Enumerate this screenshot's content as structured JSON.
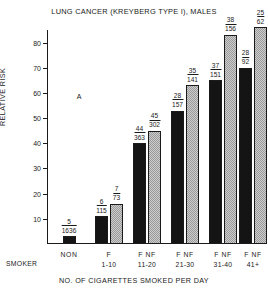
{
  "chart_data": {
    "type": "bar",
    "title": "LUNG CANCER (KREYBERG TYPE I), MALES",
    "xlabel": "NO. OF CIGARETTES SMOKED PER DAY",
    "ylabel": "RELATIVE RISK",
    "ylim": [
      0,
      85
    ],
    "yticks": [
      10,
      20,
      30,
      40,
      50,
      60,
      70,
      80
    ],
    "grid": false,
    "legend": null,
    "annotations": [
      {
        "text": "A",
        "x_frac": 0.14,
        "y_value": 60
      }
    ],
    "categories": [
      "NON SMOKER",
      "1-10",
      "11-20",
      "21-30",
      "31-40",
      "41+"
    ],
    "series": [
      {
        "name": "F",
        "values": [
          3,
          11,
          40,
          53,
          65,
          70
        ]
      },
      {
        "name": "NF",
        "values": [
          null,
          16,
          45,
          63,
          83,
          86
        ]
      }
    ],
    "bars": [
      {
        "group": "NON SMOKER",
        "group_label_lines": [
          "NON",
          ""
        ],
        "type": "non",
        "value": 3,
        "numerator": "5",
        "denominator": "1636"
      },
      {
        "group": "1-10",
        "group_label_lines": [
          "F",
          "1-10"
        ],
        "type": "f",
        "value": 11,
        "numerator": "6",
        "denominator": "115"
      },
      {
        "group": "1-10",
        "group_label_lines": [
          "",
          ""
        ],
        "type": "nf",
        "value": 16,
        "numerator": "7",
        "denominator": "73"
      },
      {
        "group": "11-20",
        "group_label_lines": [
          "F NF",
          "11-20"
        ],
        "type": "f",
        "value": 40,
        "numerator": "44",
        "denominator": "363"
      },
      {
        "group": "11-20",
        "group_label_lines": [
          "",
          ""
        ],
        "type": "nf",
        "value": 45,
        "numerator": "45",
        "denominator": "302"
      },
      {
        "group": "21-30",
        "group_label_lines": [
          "F NF",
          "21-30"
        ],
        "type": "f",
        "value": 53,
        "numerator": "28",
        "denominator": "157"
      },
      {
        "group": "21-30",
        "group_label_lines": [
          "",
          ""
        ],
        "type": "nf",
        "value": 63,
        "numerator": "35",
        "denominator": "141"
      },
      {
        "group": "31-40",
        "group_label_lines": [
          "F NF",
          "31-40"
        ],
        "type": "f",
        "value": 65,
        "numerator": "37",
        "denominator": "151"
      },
      {
        "group": "31-40",
        "group_label_lines": [
          "",
          ""
        ],
        "type": "nf",
        "value": 83,
        "numerator": "38",
        "denominator": "156"
      },
      {
        "group": "41+",
        "group_label_lines": [
          "F NF",
          "41+"
        ],
        "type": "f",
        "value": 70,
        "numerator": "28",
        "denominator": "92"
      },
      {
        "group": "41+",
        "group_label_lines": [
          "",
          ""
        ],
        "type": "nf",
        "value": 86,
        "numerator": "25",
        "denominator": "62"
      }
    ],
    "category_labels": [
      {
        "line1": "NON",
        "line2": ""
      },
      {
        "line1": "F",
        "line2": "1-10"
      },
      {
        "line1": "F NF",
        "line2": "11-20"
      },
      {
        "line1": "F NF",
        "line2": "21-30"
      },
      {
        "line1": "F NF",
        "line2": "31-40"
      },
      {
        "line1": "F NF",
        "line2": "41+"
      }
    ],
    "smoker_word": "SMOKER",
    "colors": {
      "f_bar": "#141414",
      "nf_bar": "#b4b4b4",
      "axis": "#1a1a1a",
      "background": "#ffffff"
    }
  }
}
